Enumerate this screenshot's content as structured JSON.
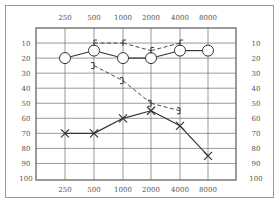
{
  "chart_data": {
    "type": "line",
    "title": "",
    "xlabel": "",
    "ylabel": "",
    "x": [
      250,
      500,
      1000,
      2000,
      4000,
      8000
    ],
    "x_tick_labels": [
      "250",
      "500",
      "1000",
      "2000",
      "4000",
      "8000"
    ],
    "y_tick_labels": [
      "10",
      "20",
      "30",
      "40",
      "50",
      "60",
      "70",
      "80",
      "90",
      "100"
    ],
    "ylim": [
      0,
      100
    ],
    "y_inverted": true,
    "grid": true,
    "legend": null,
    "series": [
      {
        "name": "O (solid)",
        "marker": "circle",
        "line": "solid",
        "x": [
          250,
          500,
          1000,
          2000,
          4000,
          8000
        ],
        "values": [
          20,
          15,
          20,
          20,
          15,
          15
        ]
      },
      {
        "name": "[ (dashed)",
        "marker": "left-bracket",
        "line": "dashed",
        "x": [
          500,
          1000,
          2000,
          4000
        ],
        "values": [
          10,
          10,
          15,
          10
        ]
      },
      {
        "name": "X (solid)",
        "marker": "cross",
        "line": "solid",
        "x": [
          250,
          500,
          1000,
          2000,
          4000,
          8000
        ],
        "values": [
          70,
          70,
          60,
          55,
          65,
          85
        ]
      },
      {
        "name": "] (dashed)",
        "marker": "right-bracket",
        "line": "dashed",
        "x": [
          500,
          1000,
          2000,
          4000
        ],
        "values": [
          25,
          35,
          50,
          55
        ]
      }
    ]
  },
  "colors": {
    "grid": "#707070",
    "frame": "#9a9a9a",
    "series": "#333333",
    "text": "#555555"
  }
}
